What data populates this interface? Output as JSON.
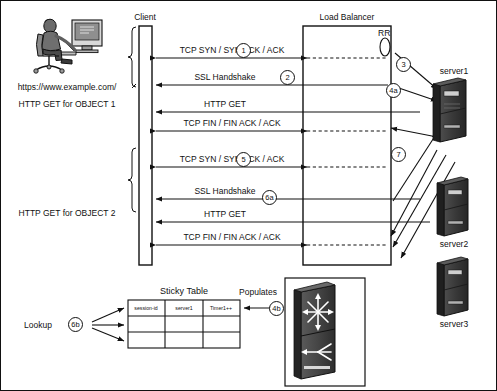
{
  "diagram": {
    "headers": {
      "client": "Client",
      "load_balancer": "Load Balancer"
    },
    "left_labels": {
      "url": "https://www.example.com/",
      "object1": "HTTP GET for OBJECT 1",
      "object2": "HTTP GET for OBJECT 2"
    },
    "messages": [
      {
        "id": "m1",
        "text": "TCP SYN / SYN ACK / ACK",
        "step": "1"
      },
      {
        "id": "m2",
        "text": "SSL Handshake",
        "step": "2"
      },
      {
        "id": "m3",
        "text": "HTTP GET",
        "step": ""
      },
      {
        "id": "m4",
        "text": "TCP FIN / FIN ACK / ACK",
        "step": ""
      },
      {
        "id": "m5",
        "text": "TCP SYN / SYN ACK / ACK",
        "step": "5"
      },
      {
        "id": "m6",
        "text": "SSL Handshake",
        "step": "6a"
      },
      {
        "id": "m7",
        "text": "HTTP GET",
        "step": ""
      },
      {
        "id": "m8",
        "text": "TCP FIN / FIN ACK / ACK",
        "step": ""
      }
    ],
    "lb_annotations": {
      "round_robin": "RR",
      "step_3": "3",
      "step_4a": "4a",
      "step_7": "7"
    },
    "servers": [
      {
        "name": "server1"
      },
      {
        "name": "server2"
      },
      {
        "name": "server3"
      }
    ],
    "sticky_table": {
      "title": "Sticky Table",
      "columns": [
        "session-id",
        "server1",
        "Timer1++"
      ],
      "rows": [
        [
          "",
          "",
          ""
        ],
        [
          "",
          "",
          ""
        ]
      ],
      "populates_label": "Populates",
      "populates_step": "4b",
      "lookup_label": "Lookup",
      "lookup_step": "6b"
    },
    "colors": {
      "line": "#111111",
      "text": "#111111",
      "background": "#ffffff",
      "server_body": "#3a3a3a",
      "server_dark": "#222222",
      "switch_body": "#4a4a4a"
    }
  }
}
